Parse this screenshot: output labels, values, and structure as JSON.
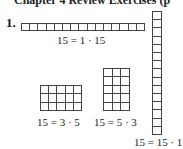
{
  "header": {
    "text": "Chapter 4 Review Exercises (p"
  },
  "exercise": {
    "number": "1."
  },
  "figures": [
    {
      "id": "1x15",
      "rows": 1,
      "cols": 15,
      "label": "15 = 1 · 15"
    },
    {
      "id": "3x5",
      "rows": 3,
      "cols": 5,
      "label": "15 = 3 · 5"
    },
    {
      "id": "5x3",
      "rows": 5,
      "cols": 3,
      "label": "15 = 5 · 3"
    },
    {
      "id": "15x1",
      "rows": 15,
      "cols": 1,
      "label": "15 = 15 · 1"
    }
  ],
  "colors": {
    "line": "#444444",
    "text": "#222222",
    "background": "#ffffff"
  }
}
